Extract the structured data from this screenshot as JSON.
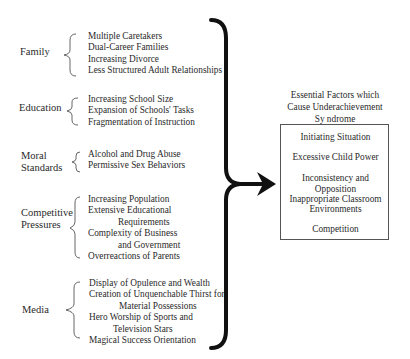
{
  "diagram": {
    "categories": [
      {
        "label": "Family",
        "items": [
          "Multiple Caretakers",
          "Dual-Career  Families",
          "Increasing  Divorce",
          "Less Structured Adult Relationships"
        ]
      },
      {
        "label": "Education",
        "items": [
          "Increasing School Size",
          "Expansion of Schools' Tasks",
          "Fragmentation of Instruction"
        ]
      },
      {
        "label_lines": [
          "Moral",
          "Standards"
        ],
        "items": [
          "Alcohol and Drug Abuse",
          "Permissive Sex Behaviors"
        ]
      },
      {
        "label_lines": [
          "Competitive",
          "Pressures"
        ],
        "items": [
          "Increasing Population",
          "Extensive Educational",
          "Requirements",
          "Complexity of Business",
          "and Government",
          "Overreactions of Parents"
        ]
      },
      {
        "label": "Media",
        "items": [
          "Display of Opulence and Wealth",
          "Creation of Unquenchable Thirst for",
          "Material Possessions",
          "Hero Worship of Sports and",
          "Television Stars",
          "Magical Success Orientation"
        ]
      }
    ],
    "result": {
      "title_lines": [
        "Essential Factors which",
        "Cause Underachievement",
        "Sy ndrome"
      ],
      "factors": [
        "Initiating Situation",
        "Excessive Child Power",
        "Inconsistency and Opposition",
        "Inappropriate Classroom",
        "Environments",
        "Competition"
      ]
    },
    "colors": {
      "ink": "#111111",
      "text": "#2a2a2a",
      "box_border": "#555555"
    }
  }
}
